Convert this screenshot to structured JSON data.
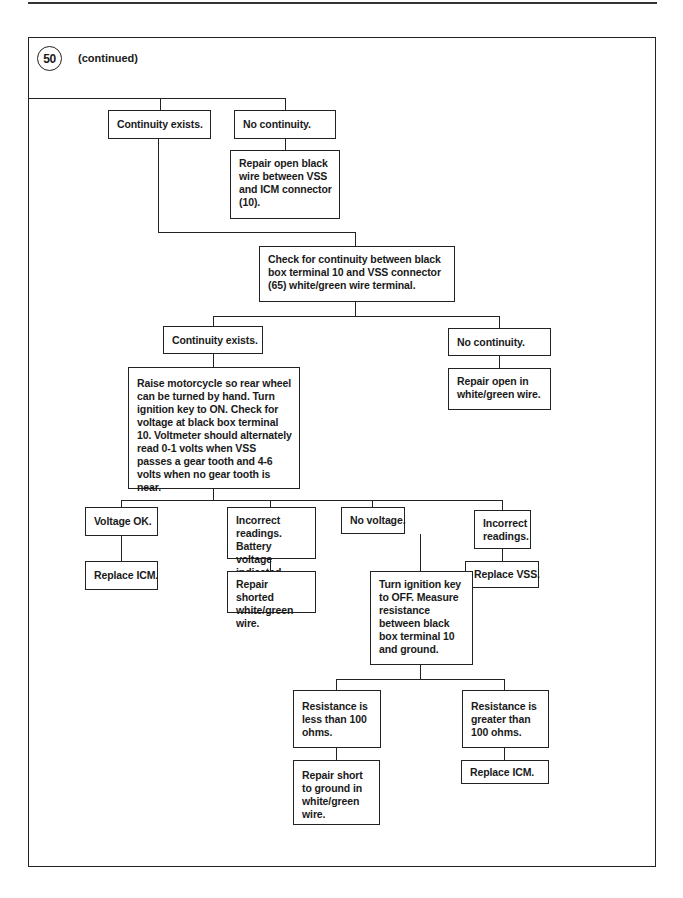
{
  "header": {
    "step_number": "50",
    "continued_label": "(continued)"
  },
  "nodes": {
    "continuity_exists_1": "Continuity exists.",
    "no_continuity_1": "No continuity.",
    "repair_open_black": "Repair open black wire between VSS and ICM connector (10).",
    "check_continuity": "Check for continuity between black box terminal 10 and VSS connector (65) white/green wire terminal.",
    "continuity_exists_2": "Continuity exists.",
    "no_continuity_2": "No continuity.",
    "repair_open_white_green": "Repair open in white/green wire.",
    "raise_motorcycle": "Raise motorcycle so rear wheel can be turned by hand. Turn ignition key to ON. Check for voltage at black box terminal 10. Voltmeter should alternately read 0-1 volts when VSS passes a gear tooth and 4-6 volts when no gear tooth is near.",
    "voltage_ok": "Voltage OK.",
    "replace_icm_1": "Replace ICM.",
    "incorrect_battery": "Incorrect readings. Battery voltage indicated.",
    "repair_shorted": "Repair shorted white/green wire.",
    "no_voltage": "No voltage.",
    "turn_ignition_off": "Turn ignition key to OFF. Measure resistance between black box terminal 10 and ground.",
    "incorrect_readings": "Incorrect readings.",
    "replace_vss": "Replace VSS.",
    "resistance_less": "Resistance is less than 100 ohms.",
    "repair_short_ground": "Repair short to ground in white/green wire.",
    "resistance_greater": "Resistance is greater than 100 ohms.",
    "replace_icm_2": "Replace ICM."
  }
}
